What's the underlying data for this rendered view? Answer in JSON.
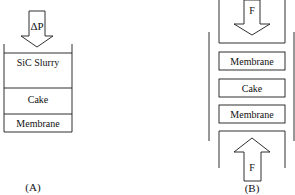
{
  "panel_a": {
    "caption": "(A)",
    "arrow_label": "ΔP",
    "layers": [
      "SiC Slurry",
      "Cake",
      "Membrane"
    ]
  },
  "panel_b": {
    "caption": "(B)",
    "top_arrow_label": "F",
    "bottom_arrow_label": "F",
    "layers": [
      "Membrane",
      "Cake",
      "Membrane"
    ]
  },
  "colors": {
    "stroke": "#1a1a1a",
    "background": "#ffffff"
  }
}
